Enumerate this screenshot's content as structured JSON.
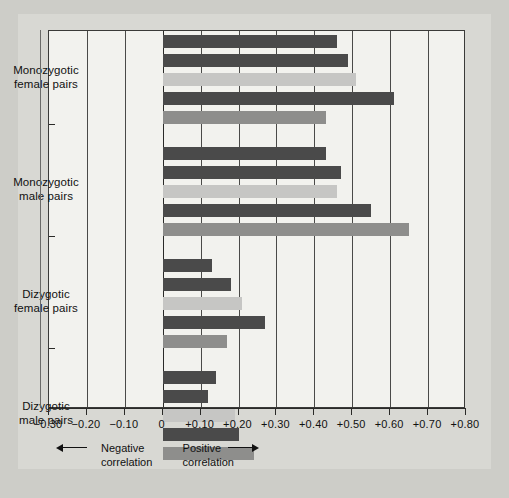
{
  "chart_data": {
    "type": "bar",
    "orientation": "horizontal",
    "title": "",
    "xlabel": "",
    "ylabel": "",
    "xlim": [
      -0.3,
      0.8
    ],
    "grid": true,
    "legend": false,
    "xticks": [
      -0.3,
      -0.2,
      -0.1,
      0,
      0.1,
      0.2,
      0.3,
      0.4,
      0.5,
      0.6,
      0.7,
      0.8
    ],
    "xticklabels": [
      "-0.30",
      "-0.20",
      "-0.10",
      "0",
      "+0.10",
      "+0.20",
      "+0.30",
      "+0.40",
      "+0.50",
      "+0.60",
      "+0.70",
      "+0.80"
    ],
    "annotations": {
      "negative": "Negative\ncorrelation",
      "positive": "Positive\ncorrelation",
      "negative_line1": "Negative",
      "negative_line2": "correlation",
      "positive_line1": "Positive",
      "positive_line2": "correlation"
    },
    "colors": {
      "dark": "#4a4a4a",
      "light": "#c6c6c4",
      "medium": "#8e8e8c",
      "panel_background": "#f2f2ee",
      "figure_background": "#d8d8d3",
      "page_background": "#cdcdc8",
      "axis": "#2a2a28"
    },
    "groups": [
      {
        "label_line1": "Monozygotic",
        "label_line2": "female pairs",
        "bars": [
          {
            "value": 0.46,
            "color": "dark"
          },
          {
            "value": 0.49,
            "color": "dark"
          },
          {
            "value": 0.51,
            "color": "light"
          },
          {
            "value": 0.61,
            "color": "dark"
          },
          {
            "value": 0.43,
            "color": "medium"
          }
        ]
      },
      {
        "label_line1": "Monozygotic",
        "label_line2": "male pairs",
        "bars": [
          {
            "value": 0.43,
            "color": "dark"
          },
          {
            "value": 0.47,
            "color": "dark"
          },
          {
            "value": 0.46,
            "color": "light"
          },
          {
            "value": 0.55,
            "color": "dark"
          },
          {
            "value": 0.65,
            "color": "medium"
          }
        ]
      },
      {
        "label_line1": "Dizygotic",
        "label_line2": "female pairs",
        "bars": [
          {
            "value": 0.13,
            "color": "dark"
          },
          {
            "value": 0.18,
            "color": "dark"
          },
          {
            "value": 0.21,
            "color": "light"
          },
          {
            "value": 0.27,
            "color": "dark"
          },
          {
            "value": 0.17,
            "color": "medium"
          }
        ]
      },
      {
        "label_line1": "Dizygotic",
        "label_line2": "male pairs",
        "bars": [
          {
            "value": 0.14,
            "color": "dark"
          },
          {
            "value": 0.12,
            "color": "dark"
          },
          {
            "value": 0.19,
            "color": "light"
          },
          {
            "value": 0.2,
            "color": "dark"
          },
          {
            "value": 0.24,
            "color": "medium"
          }
        ]
      }
    ]
  }
}
